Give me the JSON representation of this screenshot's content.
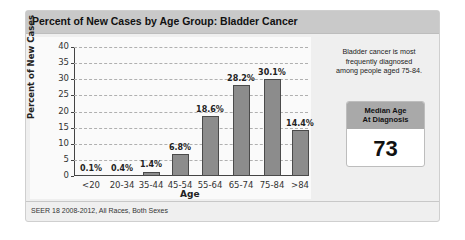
{
  "panel": {
    "title": "Percent of New Cases by Age Group: Bladder Cancer",
    "footer": "SEER 18 2008-2012, All Races, Both Sexes"
  },
  "side": {
    "text": "Bladder cancer is most frequently diagnosed among people aged 75-84.",
    "median_label_line1": "Median Age",
    "median_label_line2": "At Diagnosis",
    "median_value": "73"
  },
  "colors": {
    "bar_fill": "#8c8c8c",
    "bar_stroke": "#4a4a4a",
    "header_bg": "#c9c9c9",
    "median_header_bg": "#a9a9a9"
  },
  "chart_data": {
    "type": "bar",
    "title": "Percent of New Cases by Age Group: Bladder Cancer",
    "xlabel": "Age",
    "ylabel": "Percent of New Cases",
    "categories": [
      "<20",
      "20-34",
      "35-44",
      "45-54",
      "55-64",
      "65-74",
      "75-84",
      ">84"
    ],
    "values": [
      0.1,
      0.4,
      1.4,
      6.8,
      18.6,
      28.2,
      30.1,
      14.4
    ],
    "value_labels": [
      "0.1%",
      "0.4%",
      "1.4%",
      "6.8%",
      "18.6%",
      "28.2%",
      "30.1%",
      "14.4%"
    ],
    "yticks": [
      0,
      5,
      10,
      15,
      20,
      25,
      30,
      35,
      40
    ],
    "ylim": [
      0,
      40
    ],
    "grid": true,
    "grid_style": "dashed horizontal",
    "legend": null
  }
}
